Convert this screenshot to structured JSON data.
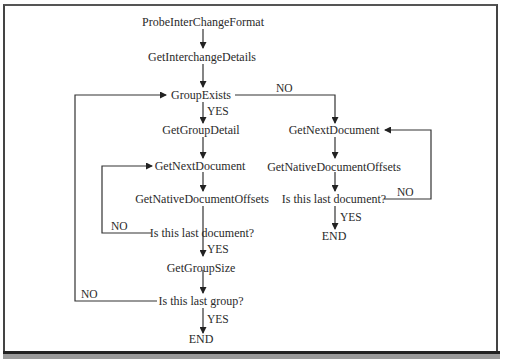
{
  "diagram": {
    "type": "flowchart",
    "nodes": {
      "probe": "ProbeInterChangeFormat",
      "interchange_details": "GetInterchangeDetails",
      "group_exists": "GroupExists",
      "group_detail": "GetGroupDetail",
      "left_next_doc": "GetNextDocument",
      "left_offsets": "GetNativeDocumentOffsets",
      "left_last_doc": "Is this last document?",
      "group_size": "GetGroupSize",
      "last_group": "Is this last group?",
      "left_end": "END",
      "right_next_doc": "GetNextDocument",
      "right_offsets": "GetNativeDocumentOffsets",
      "right_last_doc": "Is this last document?",
      "right_end": "END"
    },
    "edge_labels": {
      "group_exists_yes": "YES",
      "group_exists_no": "NO",
      "left_last_doc_no": "NO",
      "left_last_doc_yes": "YES",
      "last_group_no": "NO",
      "last_group_yes": "YES",
      "right_last_doc_no": "NO",
      "right_last_doc_yes": "YES"
    },
    "edges": [
      {
        "from": "ProbeInterChangeFormat",
        "to": "GetInterchangeDetails"
      },
      {
        "from": "GetInterchangeDetails",
        "to": "GroupExists"
      },
      {
        "from": "GroupExists",
        "to": "GetGroupDetail",
        "label": "YES"
      },
      {
        "from": "GroupExists",
        "to": "GetNextDocument (right)",
        "label": "NO"
      },
      {
        "from": "GetGroupDetail",
        "to": "GetNextDocument (left)"
      },
      {
        "from": "GetNextDocument (left)",
        "to": "GetNativeDocumentOffsets (left)"
      },
      {
        "from": "GetNativeDocumentOffsets (left)",
        "to": "Is this last document? (left)"
      },
      {
        "from": "Is this last document? (left)",
        "to": "GetNextDocument (left)",
        "label": "NO"
      },
      {
        "from": "Is this last document? (left)",
        "to": "GetGroupSize",
        "label": "YES"
      },
      {
        "from": "GetGroupSize",
        "to": "Is this last group?"
      },
      {
        "from": "Is this last group?",
        "to": "GroupExists",
        "label": "NO"
      },
      {
        "from": "Is this last group?",
        "to": "END (left)",
        "label": "YES"
      },
      {
        "from": "GetNextDocument (right)",
        "to": "GetNativeDocumentOffsets (right)"
      },
      {
        "from": "GetNativeDocumentOffsets (right)",
        "to": "Is this last document? (right)"
      },
      {
        "from": "Is this last document? (right)",
        "to": "GetNextDocument (right)",
        "label": "NO"
      },
      {
        "from": "Is this last document? (right)",
        "to": "END (right)",
        "label": "YES"
      }
    ]
  }
}
